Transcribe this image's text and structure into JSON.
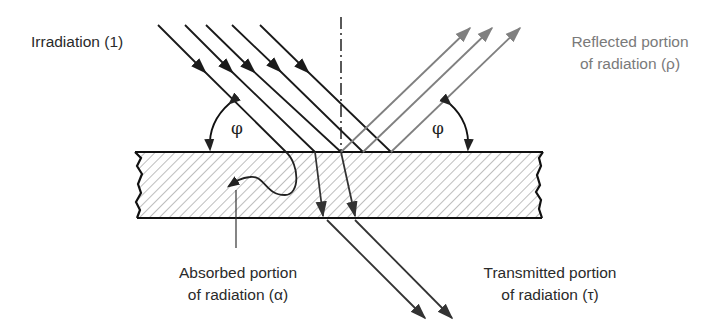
{
  "diagram": {
    "type": "physics-radiation-interaction",
    "labels": {
      "irradiation": "Irradiation (1)",
      "reflected_line1": "Reflected portion",
      "reflected_line2": "of radiation (ρ)",
      "absorbed_line1": "Absorbed portion",
      "absorbed_line2": "of radiation (α)",
      "transmitted_line1": "Transmitted portion",
      "transmitted_line2": "of radiation (τ)",
      "angle_left": "φ",
      "angle_right": "φ"
    },
    "colors": {
      "incident": "#1a1a1a",
      "reflected": "#808080",
      "transmitted": "#333333",
      "hatch": "#9a9a9a",
      "label_dark": "#2a2a2a",
      "label_grey": "#7a7a7a"
    },
    "counts": {
      "incident_rays": 5,
      "reflected_rays": 3,
      "transmitted_rays": 2,
      "absorbed_rays": 1
    }
  }
}
